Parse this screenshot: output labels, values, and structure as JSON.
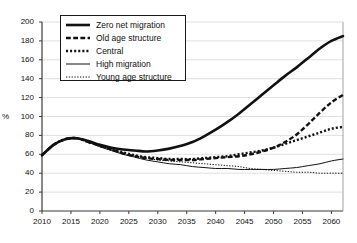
{
  "chart_data": {
    "type": "line",
    "title": "",
    "xlabel": "",
    "ylabel": "%",
    "xlim": [
      2010,
      2062
    ],
    "ylim": [
      0,
      200
    ],
    "ytick_step": 20,
    "xtick_step": 5,
    "grid": true,
    "legend_position": "top-left-inside",
    "yticks": [
      "0",
      "20",
      "40",
      "60",
      "80",
      "100",
      "120",
      "140",
      "160",
      "180",
      "200"
    ],
    "xticks": [
      "2010",
      "2015",
      "2020",
      "2025",
      "2030",
      "2035",
      "2040",
      "2045",
      "2050",
      "2055",
      "2060"
    ],
    "x": [
      2010,
      2012,
      2014,
      2016,
      2018,
      2020,
      2022,
      2024,
      2026,
      2028,
      2030,
      2032,
      2034,
      2036,
      2038,
      2040,
      2042,
      2044,
      2046,
      2048,
      2050,
      2052,
      2054,
      2056,
      2058,
      2060,
      2062
    ],
    "series": [
      {
        "name": "Zero net migration",
        "style": "solid",
        "width": 2.6,
        "color": "#111111",
        "values": [
          59,
          70,
          76,
          77,
          74,
          70,
          67,
          65,
          64,
          63,
          64,
          66,
          69,
          73,
          79,
          86,
          94,
          103,
          113,
          123,
          133,
          143,
          152,
          162,
          172,
          180,
          185
        ]
      },
      {
        "name": "Old age structure",
        "style": "dashed",
        "width": 2.4,
        "color": "#111111",
        "values": [
          59,
          70,
          76,
          77,
          73,
          69,
          65,
          61,
          58,
          56,
          55,
          54,
          54,
          54,
          55,
          56,
          57,
          58,
          60,
          63,
          67,
          73,
          81,
          92,
          104,
          115,
          123
        ]
      },
      {
        "name": "Central",
        "style": "dotted-thick",
        "width": 2.4,
        "color": "#111111",
        "values": [
          59,
          70,
          76,
          77,
          73,
          69,
          65,
          62,
          59,
          57,
          56,
          55,
          55,
          55,
          56,
          57,
          58,
          60,
          62,
          64,
          67,
          71,
          75,
          79,
          83,
          87,
          89
        ]
      },
      {
        "name": "High migration",
        "style": "solid",
        "width": 1.0,
        "color": "#111111",
        "values": [
          59,
          70,
          76,
          77,
          73,
          68,
          64,
          60,
          57,
          54,
          52,
          50,
          49,
          47,
          46,
          45,
          45,
          44,
          44,
          44,
          44,
          45,
          46,
          48,
          50,
          53,
          55
        ]
      },
      {
        "name": "Young age structure",
        "style": "dotted-thin",
        "width": 1.0,
        "color": "#111111",
        "values": [
          59,
          70,
          76,
          77,
          73,
          69,
          65,
          61,
          58,
          56,
          54,
          53,
          52,
          51,
          50,
          49,
          48,
          47,
          45,
          44,
          43,
          42,
          41,
          41,
          40,
          40,
          40
        ]
      }
    ]
  },
  "axis": {
    "y_unit_label": "%"
  },
  "legend": {
    "items": [
      {
        "label": "Zero net migration"
      },
      {
        "label": "Old age structure"
      },
      {
        "label": "Central"
      },
      {
        "label": "High migration"
      },
      {
        "label": "Young age structure"
      }
    ]
  }
}
